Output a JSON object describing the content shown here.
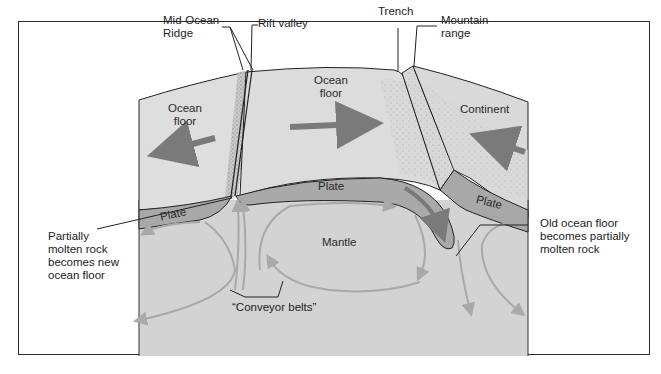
{
  "diagram": {
    "callouts": {
      "mid_ocean_ridge": [
        "Mid-Ocean",
        "Ridge"
      ],
      "rift_valley": "Rift valley",
      "trench": "Trench",
      "mountain_range": [
        "Mountain",
        "range"
      ],
      "partially_molten": [
        "Partially",
        "molten rock",
        "becomes new",
        "ocean floor"
      ],
      "old_ocean_floor": [
        "Old ocean floor",
        "becomes partially",
        "molten rock"
      ],
      "conveyor_belts": "“Conveyor belts”"
    },
    "regions": {
      "ocean_floor_left": [
        "Ocean",
        "floor"
      ],
      "ocean_floor_center": [
        "Ocean",
        "floor"
      ],
      "continent": "Continent",
      "plate_left": "Plate",
      "plate_center": "Plate",
      "plate_right": "Plate",
      "mantle": "Mantle"
    },
    "colors": {
      "surface": "#dcdcdc",
      "plate": "#a8a8a8",
      "mantle": "#d2d2d2",
      "arrow_dark": "#7a7a7a",
      "arrow_light": "#a9a9a9",
      "outline": "#222222"
    }
  }
}
